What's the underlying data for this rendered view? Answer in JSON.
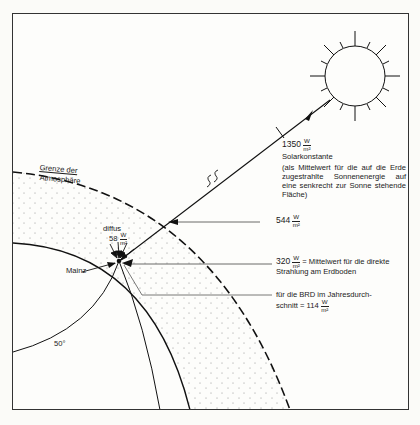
{
  "figure": {
    "sun_label": "Sonne",
    "solar_constant": {
      "value": "1350",
      "unit_num": "W",
      "unit_den": "m²",
      "title": "Solarkonstante",
      "description": "(als Mittelwert für die auf die Erde zugestrahlte Sonnenenergie auf eine senkrecht zur Sonne stehende Fläche)"
    },
    "top_of_atmosphere": {
      "value": "544",
      "unit_num": "W",
      "unit_den": "m²"
    },
    "ground_direct": {
      "value": "320",
      "unit_num": "W",
      "unit_den": "m²",
      "text_line1": "= Mittelwert für die direkte",
      "text_line2": "Strahlung am Erdboden"
    },
    "brd_average": {
      "line1": "für die BRD im Jahresdurch-",
      "line2_prefix": "schnitt = 114",
      "unit_num": "W",
      "unit_den": "m²"
    },
    "diffuse": {
      "label": "diffus",
      "value": "58",
      "unit_num": "W",
      "unit_den": "m²"
    },
    "atmosphere_label_line1": "Grenze der",
    "atmosphere_label_line2": "Atmosphäre",
    "location_label": "Mainz",
    "latitude_label": "50°"
  },
  "colors": {
    "ink": "#1a1a1a",
    "paper": "#fdfdfb",
    "stipple": "#8a8a8a"
  }
}
